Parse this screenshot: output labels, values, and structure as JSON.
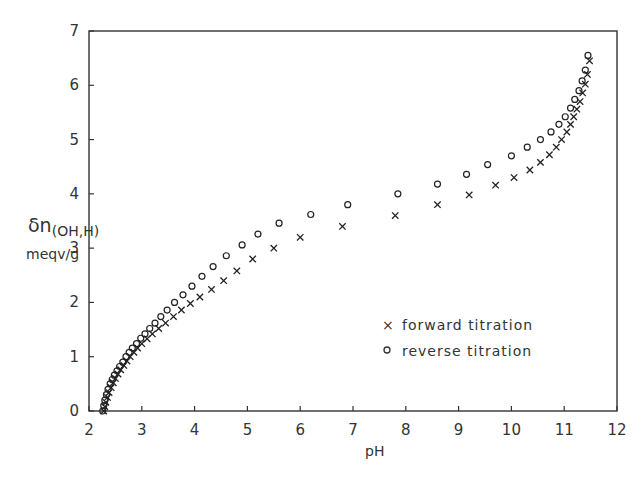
{
  "chart_data": {
    "type": "scatter",
    "title": "",
    "xlabel": "pH",
    "ylabel": "δn(OH,H) meqv/g",
    "ylabel_line1": "δn",
    "ylabel_sub": "(OH,H)",
    "ylabel_line2": "meqv/g",
    "xlim": [
      2,
      12
    ],
    "ylim": [
      0,
      7
    ],
    "xticks": [
      2,
      3,
      4,
      5,
      6,
      7,
      8,
      9,
      10,
      11,
      12
    ],
    "yticks": [
      0,
      1,
      2,
      3,
      4,
      5,
      6,
      7
    ],
    "grid": false,
    "legend_position": "lower right inside",
    "series": [
      {
        "name": "forward titration",
        "marker": "x",
        "x": [
          2.28,
          2.3,
          2.32,
          2.35,
          2.38,
          2.42,
          2.46,
          2.5,
          2.55,
          2.6,
          2.66,
          2.72,
          2.78,
          2.85,
          2.92,
          3.0,
          3.1,
          3.2,
          3.32,
          3.45,
          3.6,
          3.75,
          3.92,
          4.1,
          4.32,
          4.55,
          4.8,
          5.1,
          5.5,
          6.0,
          6.8,
          7.8,
          8.6,
          9.2,
          9.7,
          10.05,
          10.35,
          10.55,
          10.72,
          10.85,
          10.95,
          11.05,
          11.12,
          11.18,
          11.24,
          11.3,
          11.35,
          11.4,
          11.44,
          11.48
        ],
        "y": [
          0.0,
          0.08,
          0.16,
          0.25,
          0.34,
          0.43,
          0.52,
          0.6,
          0.68,
          0.76,
          0.84,
          0.92,
          1.0,
          1.08,
          1.16,
          1.24,
          1.33,
          1.42,
          1.52,
          1.62,
          1.74,
          1.86,
          1.98,
          2.1,
          2.24,
          2.4,
          2.58,
          2.8,
          3.0,
          3.2,
          3.4,
          3.6,
          3.8,
          3.98,
          4.16,
          4.3,
          4.44,
          4.58,
          4.72,
          4.86,
          5.0,
          5.14,
          5.28,
          5.42,
          5.56,
          5.7,
          5.86,
          6.02,
          6.2,
          6.45
        ]
      },
      {
        "name": "reverse titration",
        "marker": "o",
        "x": [
          2.26,
          2.28,
          2.3,
          2.33,
          2.36,
          2.4,
          2.44,
          2.48,
          2.53,
          2.58,
          2.64,
          2.7,
          2.76,
          2.82,
          2.9,
          2.98,
          3.06,
          3.15,
          3.25,
          3.36,
          3.48,
          3.62,
          3.78,
          3.95,
          4.14,
          4.35,
          4.6,
          4.9,
          5.2,
          5.6,
          6.2,
          6.9,
          7.85,
          8.6,
          9.15,
          9.55,
          10.0,
          10.3,
          10.55,
          10.75,
          10.9,
          11.02,
          11.12,
          11.2,
          11.28,
          11.34,
          11.4,
          11.45
        ],
        "y": [
          0.0,
          0.1,
          0.2,
          0.3,
          0.4,
          0.5,
          0.58,
          0.66,
          0.74,
          0.82,
          0.9,
          1.0,
          1.08,
          1.16,
          1.24,
          1.34,
          1.42,
          1.52,
          1.62,
          1.74,
          1.86,
          2.0,
          2.14,
          2.3,
          2.48,
          2.66,
          2.86,
          3.06,
          3.26,
          3.46,
          3.62,
          3.8,
          4.0,
          4.18,
          4.36,
          4.54,
          4.7,
          4.86,
          5.0,
          5.14,
          5.28,
          5.42,
          5.58,
          5.74,
          5.9,
          6.08,
          6.28,
          6.55
        ]
      }
    ]
  },
  "legend": {
    "forward_symbol": "×",
    "forward_label": "forward titration",
    "reverse_symbol": "o",
    "reverse_label": "reverse titration"
  }
}
